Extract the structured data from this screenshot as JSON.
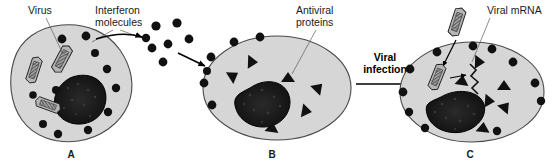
{
  "figure": {
    "title_caption": "",
    "background_color": "#ffffff"
  },
  "colors": {
    "cell_fill": "#d6d6d6",
    "cell_stroke": "#4a4a4a",
    "nucleus_fill": "#1a1a1a",
    "dot_fill": "#111111",
    "triangle_fill": "#111111",
    "virus_fill": "#9a9a9a",
    "virus_stroke": "#1a1a1a",
    "text": "#1a1a1a",
    "leader_line": "#5a5a5a",
    "arrow": "#000000"
  },
  "labels": {
    "virus": "Virus",
    "interferon_line1": "Interferon",
    "interferon_line2": "molecules",
    "antiviral_line1": "Antiviral",
    "antiviral_line2": "proteins",
    "viral_infection_line1": "Viral",
    "viral_infection_line2": "infection",
    "viral_mrna": "Viral mRNA"
  },
  "panels": [
    {
      "id": "A",
      "letter": "A",
      "letter_x": 71,
      "letter_y": 158,
      "cell_shape": "irregular-blob",
      "cell_center": [
        78,
        85
      ],
      "nucleus": "irregular-dark",
      "virus_count": 3,
      "interferon_dot_count": 10,
      "triangle_count": 0
    },
    {
      "id": "B",
      "letter": "B",
      "letter_x": 272,
      "letter_y": 158,
      "cell_shape": "ellipse",
      "cell_center": [
        277,
        88
      ],
      "nucleus": "irregular-dark",
      "virus_count": 0,
      "interferon_dot_count": 6,
      "triangle_count": 6
    },
    {
      "id": "C",
      "letter": "C",
      "letter_x": 470,
      "letter_y": 158,
      "cell_shape": "ellipse",
      "cell_center": [
        472,
        90
      ],
      "nucleus": "irregular-dark",
      "virus_count": 2,
      "interferon_dot_count": 10,
      "triangle_count": 6,
      "has_viral_mrna_zigzag": true
    }
  ],
  "interferon_cloud": {
    "description": "free interferon molecules released between cell A and cell B",
    "dot_count": 7
  },
  "arrows": {
    "release_label": "",
    "infection_label": "Viral infection"
  }
}
